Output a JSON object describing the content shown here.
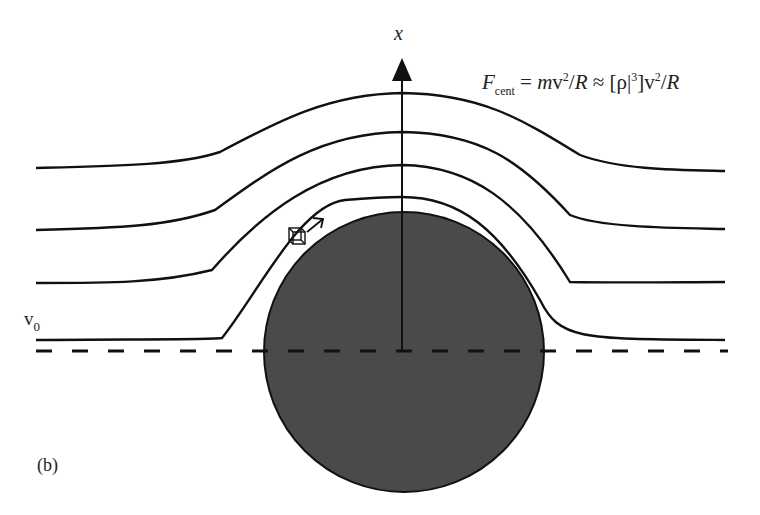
{
  "figure": {
    "panel_label": "(b)",
    "axis_label": "x",
    "velocity_label": {
      "base": "v",
      "subscript": "0"
    },
    "formula": {
      "lhs": "F",
      "lhs_sub": "cent",
      "eq": "=",
      "m": "m",
      "v1": "v",
      "sq1": "2",
      "slash1": "/",
      "R1": "R",
      "approx": "≈",
      "bracket_open": "[ρ|",
      "cube": "3",
      "bracket_close": "]",
      "v2": "v",
      "sq2": "2",
      "slash2": "/",
      "R2": "R"
    },
    "colors": {
      "line": "#111111",
      "sphere_fill": "#4a4a4a",
      "background": "#ffffff"
    },
    "sphere": {
      "cx": 404,
      "cy": 352,
      "r": 140
    },
    "streamlines_count": 4,
    "elements": [
      "streamlines",
      "sphere",
      "x-axis-arrow",
      "dashed-symmetry-line",
      "fluid-element-cube",
      "velocity-arrow"
    ]
  }
}
